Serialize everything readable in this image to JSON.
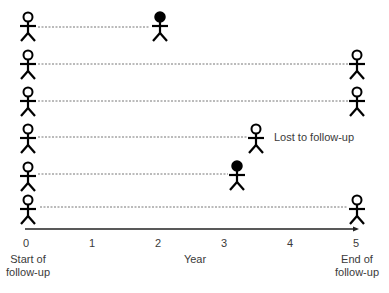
{
  "diagram": {
    "axis": {
      "label": "Year",
      "ticks": [
        "0",
        "1",
        "2",
        "3",
        "4",
        "5"
      ],
      "start_label_line1": "Start of",
      "start_label_line2": "follow-up",
      "end_label_line1": "End of",
      "end_label_line2": "follow-up"
    },
    "annotation": "Lost to follow-up",
    "participants": [
      {
        "row": 1,
        "end_year": 2.0,
        "end_state": "event (filled)"
      },
      {
        "row": 2,
        "end_year": 5.0,
        "end_state": "no event (open)"
      },
      {
        "row": 3,
        "end_year": 5.0,
        "end_state": "no event (open)"
      },
      {
        "row": 4,
        "end_year": 3.5,
        "end_state": "lost to follow-up (open)"
      },
      {
        "row": 5,
        "end_year": 3.2,
        "end_state": "event (filled)"
      },
      {
        "row": 6,
        "end_year": 5.0,
        "end_state": "no event (open)"
      }
    ],
    "colors": {
      "figure": "#000000",
      "line": "#777777",
      "text": "#3a3a3a"
    }
  }
}
